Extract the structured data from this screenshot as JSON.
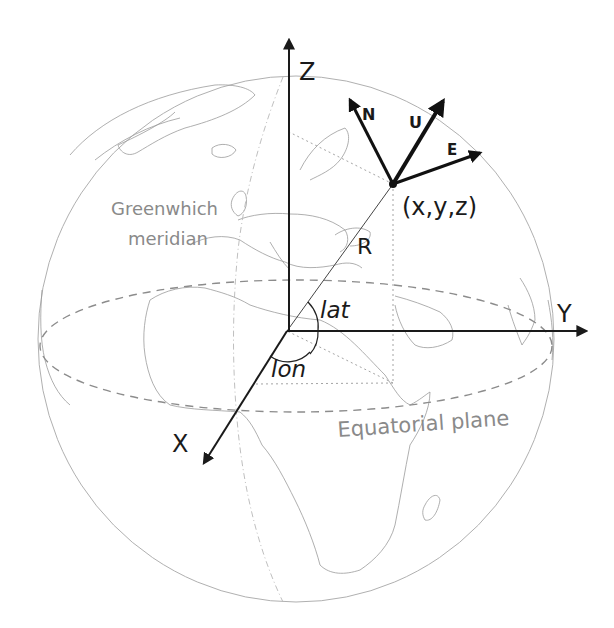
{
  "axes": {
    "z_label": "Z",
    "y_label": "Y",
    "x_label": "X"
  },
  "local_frame": {
    "north_label": "N",
    "up_label": "U",
    "east_label": "E",
    "point_label": "(x,y,z)"
  },
  "angles": {
    "radius_label": "R",
    "latitude_label": "lat",
    "longitude_label": "lon"
  },
  "annotations": {
    "meridian_line1": "Greenwhich",
    "meridian_line2": "meridian",
    "equator_label": "Equatorial plane"
  },
  "colors": {
    "axis": "#1a1a1a",
    "annotation_text": "#8a8a8a",
    "globe_outline": "#b0b0b0",
    "equator_dashes": "#8c8c8c",
    "projection_dots": "#9a9a9a"
  }
}
